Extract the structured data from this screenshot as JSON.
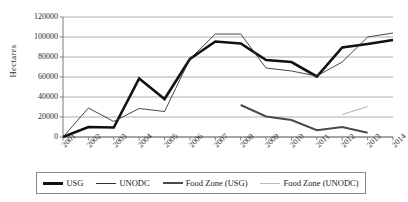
{
  "chart_data": {
    "type": "line",
    "title": "",
    "xlabel": "",
    "ylabel": "Hectares",
    "x": [
      "2001",
      "2002",
      "2003",
      "2004",
      "2005",
      "2006",
      "2007",
      "2008",
      "2009",
      "2010",
      "2011",
      "2012",
      "2013",
      "2014"
    ],
    "ylim": [
      0,
      120000
    ],
    "ytick_values": [
      0,
      20000,
      40000,
      60000,
      80000,
      100000,
      120000
    ],
    "ytick_labels": [
      "0",
      "20000",
      "40000",
      "60000",
      "80000",
      "100000",
      "120000"
    ],
    "grid": true,
    "grid_axis": "y",
    "legend_position": "bottom",
    "series": [
      {
        "name": "USG",
        "color": "#111111",
        "width": 2.6,
        "values": [
          0,
          10000,
          9500,
          58500,
          38000,
          78000,
          95500,
          93500,
          77000,
          75000,
          60500,
          89500,
          93000,
          97000
        ]
      },
      {
        "name": "UNODC",
        "color": "#333333",
        "width": 0.9,
        "values": [
          0,
          29000,
          15500,
          28500,
          25500,
          78000,
          103000,
          103000,
          69000,
          66000,
          61000,
          75000,
          100000,
          104000
        ]
      },
      {
        "name": "Food Zone (USG)",
        "color": "#4a4a4a",
        "width": 2.0,
        "values": [
          null,
          null,
          null,
          null,
          null,
          null,
          null,
          32000,
          20500,
          17000,
          6800,
          10000,
          4200,
          null
        ]
      },
      {
        "name": "Food Zone (UNODC)",
        "color": "#b0b0b0",
        "width": 1.0,
        "values": [
          null,
          null,
          null,
          null,
          null,
          null,
          null,
          null,
          null,
          null,
          null,
          22500,
          30500,
          null
        ]
      }
    ]
  },
  "axis": {
    "ylabel": "Hectares",
    "yticks": [
      "120000",
      "100000",
      "80000",
      "60000",
      "40000",
      "20000",
      "0"
    ],
    "xticks": [
      "2001",
      "2002",
      "2003",
      "2004",
      "2005",
      "2006",
      "2007",
      "2008",
      "2009",
      "2010",
      "2011",
      "2012",
      "2013",
      "2014"
    ]
  },
  "legend": {
    "items": [
      {
        "label": "USG",
        "color": "#111111",
        "thickness": "3px"
      },
      {
        "label": "UNODC",
        "color": "#333333",
        "thickness": "1px"
      },
      {
        "label": "Food Zone (USG)",
        "color": "#4a4a4a",
        "thickness": "2.5px"
      },
      {
        "label": "Food Zone (UNODC)",
        "color": "#b9b9b9",
        "thickness": "1px"
      }
    ]
  }
}
